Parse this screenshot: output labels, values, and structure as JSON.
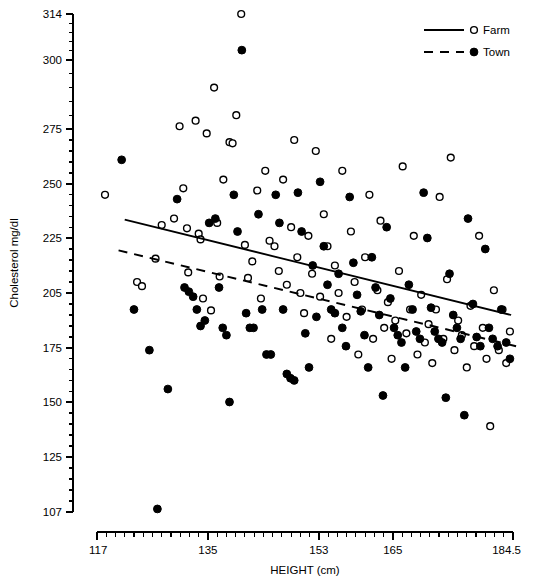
{
  "chart_data": {
    "type": "scatter",
    "title": "",
    "xlabel": "HEIGHT (cm)",
    "ylabel": "Cholesterol mg/dl",
    "xlim": [
      117,
      184.5
    ],
    "ylim": [
      107,
      314
    ],
    "grid": false,
    "legend_position": "top-right",
    "xticks": [
      117,
      135,
      153,
      165,
      184.5
    ],
    "xtick_labels": [
      "117",
      "135",
      "153",
      "165",
      "184.5"
    ],
    "yticks": [
      107,
      125,
      150,
      175,
      205,
      225,
      250,
      275,
      300,
      314
    ],
    "ytick_labels": [
      "107",
      "125",
      "150",
      "175",
      "205",
      "225",
      "250",
      "275",
      "300",
      "314"
    ],
    "legend": [
      {
        "name": "Farm",
        "marker": "open-circle",
        "line": "solid"
      },
      {
        "name": "Town",
        "marker": "filled-circle",
        "line": "dashed"
      }
    ],
    "series": [
      {
        "name": "Farm",
        "marker": "open-circle",
        "trendline": {
          "style": "solid",
          "x": [
            121.5,
            184.2
          ],
          "y": [
            233.5,
            193.0
          ]
        },
        "points": [
          [
            118.3,
            245.0
          ],
          [
            123.5,
            209.0
          ],
          [
            124.3,
            207.5
          ],
          [
            126.5,
            217.5
          ],
          [
            127.5,
            231.0
          ],
          [
            129.5,
            234.0
          ],
          [
            130.4,
            276.0
          ],
          [
            131.0,
            248.0
          ],
          [
            131.6,
            229.5
          ],
          [
            131.8,
            212.5
          ],
          [
            133.0,
            278.0
          ],
          [
            133.5,
            227.0
          ],
          [
            133.8,
            224.5
          ],
          [
            134.2,
            202.0
          ],
          [
            134.8,
            273.0
          ],
          [
            135.5,
            195.5
          ],
          [
            136.0,
            290.0
          ],
          [
            136.5,
            232.0
          ],
          [
            136.9,
            211.0
          ],
          [
            137.5,
            252.0
          ],
          [
            138.5,
            269.0
          ],
          [
            139.0,
            268.5
          ],
          [
            139.6,
            280.0
          ],
          [
            140.4,
            314.0
          ],
          [
            141.0,
            222.5
          ],
          [
            141.5,
            210.5
          ],
          [
            142.2,
            216.5
          ],
          [
            143.0,
            247.0
          ],
          [
            143.6,
            202.0
          ],
          [
            144.3,
            256.0
          ],
          [
            145.0,
            224.0
          ],
          [
            145.8,
            222.0
          ],
          [
            146.5,
            213.0
          ],
          [
            147.2,
            252.0
          ],
          [
            147.8,
            208.0
          ],
          [
            148.5,
            230.0
          ],
          [
            149.0,
            270.0
          ],
          [
            149.5,
            218.0
          ],
          [
            150.0,
            205.0
          ],
          [
            150.6,
            194.0
          ],
          [
            151.3,
            226.0
          ],
          [
            151.9,
            212.0
          ],
          [
            152.5,
            265.0
          ],
          [
            153.2,
            203.0
          ],
          [
            153.8,
            236.0
          ],
          [
            154.4,
            222.0
          ],
          [
            155.0,
            180.0
          ],
          [
            155.6,
            215.0
          ],
          [
            156.2,
            205.0
          ],
          [
            156.8,
            256.0
          ],
          [
            157.5,
            192.0
          ],
          [
            158.2,
            228.0
          ],
          [
            158.8,
            209.0
          ],
          [
            159.4,
            172.0
          ],
          [
            160.0,
            196.0
          ],
          [
            160.5,
            218.0
          ],
          [
            161.2,
            245.0
          ],
          [
            161.8,
            180.0
          ],
          [
            162.5,
            206.0
          ],
          [
            163.0,
            233.0
          ],
          [
            163.6,
            186.0
          ],
          [
            164.2,
            200.0
          ],
          [
            164.8,
            170.0
          ],
          [
            165.4,
            190.0
          ],
          [
            166.0,
            213.0
          ],
          [
            166.6,
            258.0
          ],
          [
            167.2,
            183.0
          ],
          [
            167.8,
            196.0
          ],
          [
            168.4,
            226.0
          ],
          [
            169.0,
            172.0
          ],
          [
            169.6,
            204.0
          ],
          [
            170.2,
            178.0
          ],
          [
            170.8,
            188.0
          ],
          [
            171.4,
            168.0
          ],
          [
            172.0,
            196.0
          ],
          [
            172.6,
            244.0
          ],
          [
            173.2,
            180.0
          ],
          [
            173.8,
            210.0
          ],
          [
            174.4,
            262.0
          ],
          [
            175.0,
            174.0
          ],
          [
            175.6,
            190.0
          ],
          [
            176.2,
            182.0
          ],
          [
            177.0,
            166.0
          ],
          [
            177.6,
            198.0
          ],
          [
            178.2,
            176.0
          ],
          [
            179.0,
            226.0
          ],
          [
            179.6,
            186.0
          ],
          [
            180.2,
            170.0
          ],
          [
            180.8,
            139.0
          ],
          [
            181.4,
            206.0
          ],
          [
            182.2,
            174.0
          ],
          [
            182.8,
            196.0
          ],
          [
            183.4,
            168.0
          ],
          [
            184.0,
            184.0
          ]
        ]
      },
      {
        "name": "Town",
        "marker": "filled-circle",
        "trendline": {
          "style": "dashed",
          "x": [
            120.5,
            185.0
          ],
          "y": [
            220.5,
            176.0
          ]
        },
        "points": [
          [
            121.0,
            261.0
          ],
          [
            123.0,
            196.0
          ],
          [
            125.5,
            174.0
          ],
          [
            126.8,
            108.0
          ],
          [
            128.5,
            156.0
          ],
          [
            130.0,
            243.0
          ],
          [
            131.2,
            207.0
          ],
          [
            131.9,
            205.5
          ],
          [
            132.6,
            203.0
          ],
          [
            133.2,
            196.0
          ],
          [
            133.8,
            187.0
          ],
          [
            134.5,
            190.0
          ],
          [
            135.2,
            232.0
          ],
          [
            136.2,
            234.0
          ],
          [
            136.8,
            207.0
          ],
          [
            137.4,
            186.0
          ],
          [
            138.0,
            182.0
          ],
          [
            138.5,
            150.0
          ],
          [
            139.2,
            245.0
          ],
          [
            139.8,
            228.0
          ],
          [
            140.5,
            303.0
          ],
          [
            141.2,
            194.0
          ],
          [
            141.8,
            186.0
          ],
          [
            142.4,
            186.0
          ],
          [
            143.2,
            236.0
          ],
          [
            143.8,
            196.0
          ],
          [
            144.5,
            172.0
          ],
          [
            145.2,
            172.0
          ],
          [
            146.0,
            245.0
          ],
          [
            146.6,
            232.0
          ],
          [
            147.2,
            196.0
          ],
          [
            147.8,
            163.0
          ],
          [
            148.4,
            161.0
          ],
          [
            149.0,
            160.0
          ],
          [
            149.6,
            246.0
          ],
          [
            150.2,
            228.0
          ],
          [
            150.8,
            183.0
          ],
          [
            151.4,
            166.0
          ],
          [
            152.0,
            215.0
          ],
          [
            152.6,
            192.0
          ],
          [
            153.2,
            251.0
          ],
          [
            153.8,
            222.0
          ],
          [
            154.4,
            208.0
          ],
          [
            155.0,
            196.0
          ],
          [
            155.6,
            194.0
          ],
          [
            156.2,
            212.0
          ],
          [
            156.8,
            186.0
          ],
          [
            157.4,
            176.0
          ],
          [
            158.0,
            244.0
          ],
          [
            158.6,
            216.0
          ],
          [
            159.2,
            204.0
          ],
          [
            159.8,
            195.0
          ],
          [
            160.4,
            182.0
          ],
          [
            161.0,
            166.0
          ],
          [
            161.6,
            218.0
          ],
          [
            162.2,
            207.0
          ],
          [
            162.8,
            193.0
          ],
          [
            163.4,
            153.0
          ],
          [
            164.0,
            230.0
          ],
          [
            164.6,
            202.0
          ],
          [
            165.2,
            186.0
          ],
          [
            165.8,
            182.0
          ],
          [
            166.4,
            178.0
          ],
          [
            167.0,
            166.0
          ],
          [
            167.6,
            208.0
          ],
          [
            168.2,
            196.0
          ],
          [
            168.8,
            184.0
          ],
          [
            169.4,
            180.0
          ],
          [
            170.0,
            246.0
          ],
          [
            170.6,
            225.0
          ],
          [
            171.2,
            197.0
          ],
          [
            171.8,
            184.0
          ],
          [
            172.4,
            180.0
          ],
          [
            173.0,
            178.0
          ],
          [
            173.6,
            152.0
          ],
          [
            174.2,
            212.0
          ],
          [
            174.8,
            193.0
          ],
          [
            175.4,
            186.0
          ],
          [
            176.0,
            180.0
          ],
          [
            176.6,
            144.0
          ],
          [
            177.2,
            234.0
          ],
          [
            178.0,
            199.0
          ],
          [
            178.6,
            181.0
          ],
          [
            179.2,
            176.0
          ],
          [
            180.0,
            221.0
          ],
          [
            180.6,
            186.0
          ],
          [
            181.2,
            180.0
          ],
          [
            182.0,
            176.0
          ],
          [
            182.6,
            196.0
          ],
          [
            183.4,
            178.0
          ],
          [
            184.0,
            170.0
          ]
        ]
      }
    ]
  }
}
